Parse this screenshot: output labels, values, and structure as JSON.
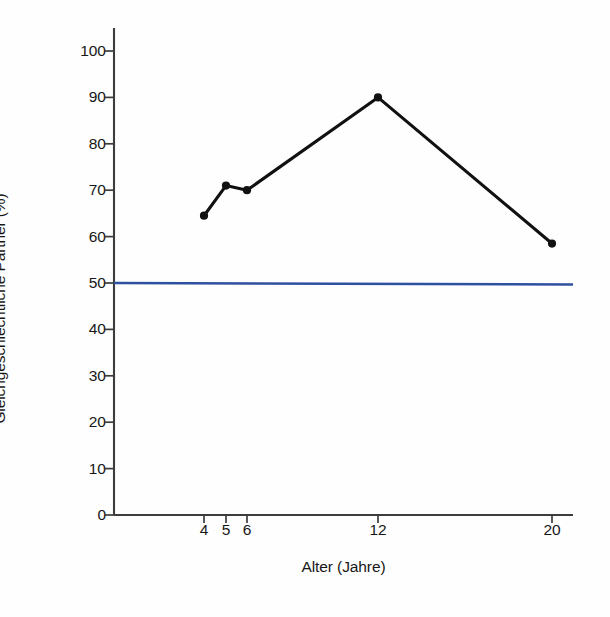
{
  "chart_data": {
    "type": "line",
    "title": "",
    "xlabel": "Alter (Jahre)",
    "ylabel": "Gleichgeschlechtliche Partner (%)",
    "x": [
      4,
      5,
      6,
      12,
      20
    ],
    "xtick_labels": [
      "4",
      "5",
      "6",
      "12",
      "20"
    ],
    "values": [
      64.5,
      71,
      70,
      90,
      58.5
    ],
    "series": [
      {
        "name": "Gleichgeschlechtliche Partner",
        "values": [
          64.5,
          71,
          70,
          90,
          58.5
        ],
        "color": "#111111",
        "marker": "circle"
      }
    ],
    "reference_line": {
      "value": 50,
      "color": "#2e50a0",
      "orientation": "horizontal"
    },
    "ylim": [
      0,
      100
    ],
    "ytick_labels": [
      "0",
      "10",
      "20",
      "30",
      "40",
      "50",
      "60",
      "70",
      "80",
      "90",
      "100"
    ],
    "yticks": [
      0,
      10,
      20,
      30,
      40,
      50,
      60,
      70,
      80,
      90,
      100
    ],
    "grid": false,
    "legend": "none",
    "axis_color": "#3c3c3c",
    "background": "#fefefe"
  }
}
